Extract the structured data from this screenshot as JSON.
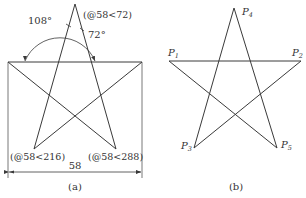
{
  "figure_a": {
    "angle_large": "108°",
    "angle_small": "72°",
    "label_top": "(@58<72)",
    "label_bottom_left": "(@58<216)",
    "label_bottom_right": "(@58<288)",
    "dimension": "58",
    "caption": "(a)"
  },
  "figure_b": {
    "p1": "P",
    "p1_sub": "1",
    "p2": "P",
    "p2_sub": "2",
    "p3": "P",
    "p3_sub": "3",
    "p4": "P",
    "p4_sub": "4",
    "p5": "P",
    "p5_sub": "5",
    "caption": "(b)"
  },
  "colors": {
    "line": "#3a3a3a",
    "text": "#333333"
  }
}
